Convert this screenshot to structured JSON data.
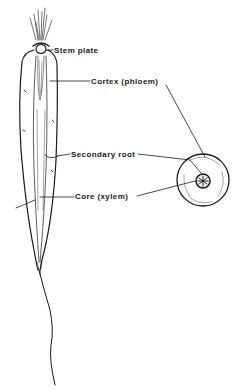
{
  "diagram": {
    "labels": {
      "stem_plate": "Stem plate",
      "cortex": "Cortex (phloem)",
      "secondary_root": "Secondary root",
      "core": "Core (xylem)"
    },
    "views": [
      "longitudinal-section",
      "cross-section"
    ],
    "colors": {
      "ink": "#1a1a1a",
      "background": "#ffffff"
    }
  }
}
